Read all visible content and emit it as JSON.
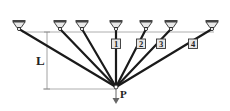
{
  "diagram": {
    "title": "",
    "colors": {
      "bar": "#1a1a1a",
      "support": "#444444",
      "support_fill": "#e8e8e8",
      "dimension": "#888888",
      "box_fill": "#e6e6e6",
      "box_stroke": "#333333"
    },
    "dimension_label": "L",
    "load_label": "P",
    "node": {
      "x": 116,
      "y": 87
    },
    "reference_line_y": 32,
    "supports": [
      {
        "id": "s1",
        "x": 19
      },
      {
        "id": "s2",
        "x": 60
      },
      {
        "id": "s3",
        "x": 82
      },
      {
        "id": "s4",
        "x": 116
      },
      {
        "id": "s5",
        "x": 146
      },
      {
        "id": "s6",
        "x": 171
      },
      {
        "id": "s7",
        "x": 212
      }
    ],
    "bar_labels": [
      {
        "text": "1",
        "x": 116,
        "y": 44
      },
      {
        "text": "2",
        "x": 141,
        "y": 44
      },
      {
        "text": "3",
        "x": 161,
        "y": 44
      },
      {
        "text": "4",
        "x": 193,
        "y": 44
      }
    ]
  }
}
